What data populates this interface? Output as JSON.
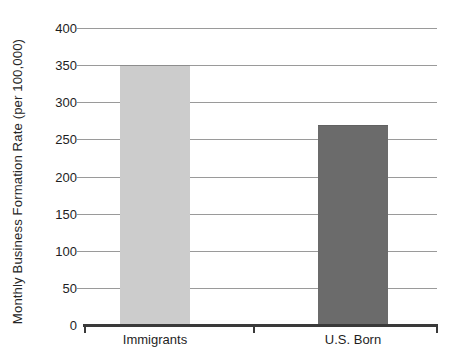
{
  "chart_data": {
    "type": "bar",
    "title": "",
    "subtitle": "",
    "xlabel": "",
    "ylabel": "Monthly Business Formation Rate (per 100,000)",
    "categories": [
      "Immigrants",
      "U.S. Born"
    ],
    "values": [
      350,
      270
    ],
    "series": [
      {
        "name": "Monthly Business Formation Rate",
        "values": [
          350,
          270
        ]
      }
    ],
    "bar_colors": [
      "#cccccc",
      "#6b6b6b"
    ],
    "ylim": [
      0,
      400
    ],
    "y_ticks": [
      0,
      50,
      100,
      150,
      200,
      250,
      300,
      350,
      400
    ],
    "y_tick_labels": [
      "0",
      "50",
      "100",
      "150",
      "200",
      "250",
      "300",
      "350",
      "400"
    ],
    "grid": true,
    "grid_axis": "y",
    "legend": false,
    "legend_position": "none",
    "annotations": []
  },
  "axis": {
    "y_title": "Monthly Business Formation Rate (per 100,000)"
  },
  "colors": {
    "immigrants_bar": "#cccccc",
    "us_born_bar": "#6b6b6b",
    "gridline": "#9a9a9a",
    "axis_line": "#3a3a3a",
    "text": "#1e1e1e",
    "background": "#ffffff"
  }
}
